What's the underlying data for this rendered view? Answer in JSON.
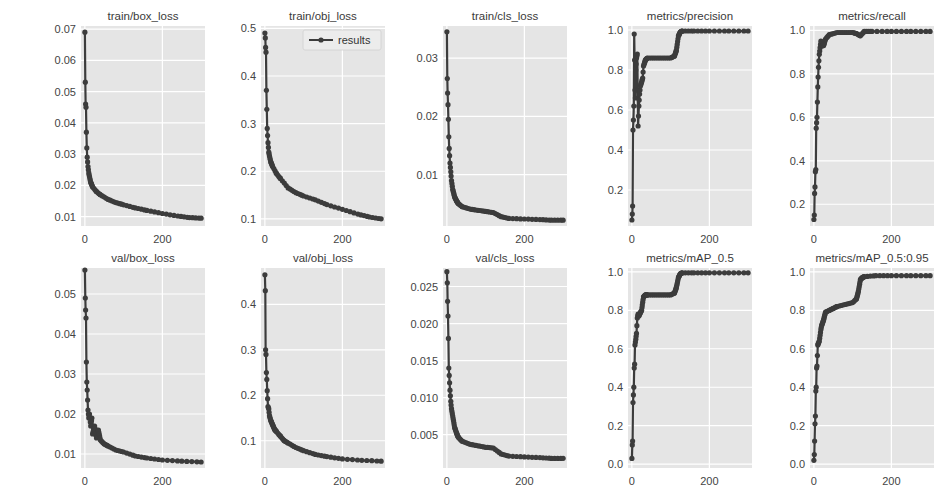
{
  "figure": {
    "background": "#ffffff",
    "axes_bg": "#e5e5e5",
    "grid_color": "#ffffff",
    "line_color": "#3c3c3c",
    "legend": {
      "label": "results",
      "panel": "train/obj_loss",
      "position": "upper right"
    }
  },
  "chart_data": [
    {
      "type": "line",
      "title": "train/box_loss",
      "xlabel": "",
      "ylabel": "",
      "xlim": [
        -10,
        310
      ],
      "ylim": [
        0.007,
        0.071
      ],
      "xticks": [
        0,
        200
      ],
      "yticks": [
        0.01,
        0.02,
        0.03,
        0.04,
        0.05,
        0.06,
        0.07
      ],
      "ytick_labels": [
        "0.01",
        "0.02",
        "0.03",
        "0.04",
        "0.05",
        "0.06",
        "0.07"
      ],
      "x": [
        0,
        1,
        2,
        3,
        4,
        5,
        6,
        8,
        10,
        15,
        20,
        30,
        40,
        60,
        80,
        100,
        130,
        160,
        200,
        240,
        270,
        300
      ],
      "y": [
        0.069,
        0.053,
        0.046,
        0.045,
        0.037,
        0.032,
        0.029,
        0.026,
        0.024,
        0.021,
        0.0195,
        0.018,
        0.017,
        0.0155,
        0.0145,
        0.0138,
        0.0128,
        0.012,
        0.011,
        0.0102,
        0.0097,
        0.0095
      ]
    },
    {
      "type": "line",
      "title": "train/obj_loss",
      "xlabel": "",
      "ylabel": "",
      "xlim": [
        -10,
        310
      ],
      "ylim": [
        0.085,
        0.505
      ],
      "xticks": [
        0,
        200
      ],
      "yticks": [
        0.1,
        0.2,
        0.3,
        0.4,
        0.5
      ],
      "ytick_labels": [
        "0.1",
        "0.2",
        "0.3",
        "0.4",
        "0.5"
      ],
      "x": [
        0,
        1,
        2,
        3,
        4,
        5,
        6,
        8,
        10,
        15,
        20,
        30,
        40,
        60,
        80,
        100,
        130,
        160,
        200,
        240,
        270,
        300
      ],
      "y": [
        0.49,
        0.48,
        0.46,
        0.45,
        0.37,
        0.33,
        0.29,
        0.26,
        0.24,
        0.22,
        0.21,
        0.195,
        0.185,
        0.165,
        0.155,
        0.148,
        0.14,
        0.13,
        0.12,
        0.11,
        0.104,
        0.1
      ]
    },
    {
      "type": "line",
      "title": "train/cls_loss",
      "xlabel": "",
      "ylabel": "",
      "xlim": [
        -10,
        310
      ],
      "ylim": [
        0.0012,
        0.0355
      ],
      "xticks": [
        0,
        200
      ],
      "yticks": [
        0.01,
        0.02,
        0.03
      ],
      "ytick_labels": [
        "0.01",
        "0.02",
        "0.03"
      ],
      "x": [
        0,
        1,
        2,
        3,
        4,
        5,
        6,
        8,
        10,
        12,
        15,
        20,
        25,
        30,
        40,
        60,
        80,
        100,
        120,
        140,
        160,
        200,
        240,
        270,
        300
      ],
      "y": [
        0.0345,
        0.0265,
        0.024,
        0.022,
        0.0195,
        0.0165,
        0.0145,
        0.012,
        0.0105,
        0.009,
        0.0075,
        0.0062,
        0.0055,
        0.005,
        0.0045,
        0.0041,
        0.0039,
        0.0037,
        0.0035,
        0.0028,
        0.0025,
        0.0024,
        0.0023,
        0.0022,
        0.0022
      ]
    },
    {
      "type": "line",
      "title": "metrics/precision",
      "xlabel": "",
      "ylabel": "",
      "xlim": [
        -10,
        310
      ],
      "ylim": [
        0.02,
        1.02
      ],
      "xticks": [
        0,
        200
      ],
      "yticks": [
        0.2,
        0.4,
        0.6,
        0.8,
        1.0
      ],
      "ytick_labels": [
        "0.2",
        "0.4",
        "0.6",
        "0.8",
        "1.0"
      ],
      "x": [
        0,
        1,
        2,
        3,
        4,
        5,
        6,
        7,
        8,
        9,
        10,
        12,
        14,
        16,
        18,
        20,
        22,
        25,
        28,
        30,
        35,
        40,
        60,
        80,
        100,
        110,
        115,
        120,
        125,
        130,
        160,
        200,
        250,
        300
      ],
      "y": [
        0.05,
        0.08,
        0.12,
        0.5,
        0.55,
        0.62,
        0.98,
        0.85,
        0.7,
        0.66,
        0.8,
        0.86,
        0.88,
        0.52,
        0.62,
        0.68,
        0.72,
        0.74,
        0.76,
        0.82,
        0.85,
        0.86,
        0.86,
        0.86,
        0.86,
        0.87,
        0.9,
        0.97,
        0.99,
        0.995,
        0.995,
        0.995,
        0.995,
        0.995
      ]
    },
    {
      "type": "line",
      "title": "metrics/recall",
      "xlabel": "",
      "ylabel": "",
      "xlim": [
        -10,
        310
      ],
      "ylim": [
        0.1,
        1.02
      ],
      "xticks": [
        0,
        200
      ],
      "yticks": [
        0.2,
        0.4,
        0.6,
        0.8,
        1.0
      ],
      "ytick_labels": [
        "0.2",
        "0.4",
        "0.6",
        "0.8",
        "1.0"
      ],
      "x": [
        0,
        1,
        2,
        3,
        4,
        5,
        6,
        8,
        10,
        12,
        14,
        16,
        18,
        20,
        25,
        30,
        40,
        60,
        80,
        100,
        110,
        120,
        130,
        150,
        200,
        250,
        300
      ],
      "y": [
        0.13,
        0.15,
        0.25,
        0.28,
        0.35,
        0.36,
        0.55,
        0.6,
        0.74,
        0.83,
        0.89,
        0.92,
        0.95,
        0.93,
        0.93,
        0.96,
        0.98,
        0.99,
        0.99,
        0.99,
        0.985,
        0.975,
        0.995,
        0.995,
        0.995,
        0.995,
        0.995
      ]
    },
    {
      "type": "line",
      "title": "val/box_loss",
      "xlabel": "",
      "ylabel": "",
      "xlim": [
        -10,
        310
      ],
      "ylim": [
        0.0065,
        0.0565
      ],
      "xticks": [
        0,
        200
      ],
      "yticks": [
        0.01,
        0.02,
        0.03,
        0.04,
        0.05
      ],
      "ytick_labels": [
        "0.01",
        "0.02",
        "0.03",
        "0.04",
        "0.05"
      ],
      "x": [
        0,
        1,
        2,
        3,
        4,
        5,
        6,
        8,
        10,
        12,
        15,
        18,
        20,
        25,
        30,
        35,
        40,
        50,
        60,
        80,
        100,
        130,
        160,
        200,
        250,
        300
      ],
      "y": [
        0.056,
        0.049,
        0.046,
        0.044,
        0.033,
        0.028,
        0.026,
        0.021,
        0.019,
        0.02,
        0.017,
        0.019,
        0.015,
        0.017,
        0.014,
        0.016,
        0.0135,
        0.0125,
        0.012,
        0.011,
        0.0105,
        0.0095,
        0.009,
        0.0085,
        0.0082,
        0.008
      ]
    },
    {
      "type": "line",
      "title": "val/obj_loss",
      "xlabel": "",
      "ylabel": "",
      "xlim": [
        -10,
        310
      ],
      "ylim": [
        0.04,
        0.48
      ],
      "xticks": [
        0,
        200
      ],
      "yticks": [
        0.1,
        0.2,
        0.3,
        0.4
      ],
      "ytick_labels": [
        "0.1",
        "0.2",
        "0.3",
        "0.4"
      ],
      "x": [
        0,
        1,
        2,
        3,
        4,
        5,
        6,
        8,
        10,
        12,
        15,
        20,
        25,
        30,
        40,
        50,
        60,
        80,
        100,
        130,
        160,
        200,
        250,
        300
      ],
      "y": [
        0.465,
        0.43,
        0.3,
        0.29,
        0.25,
        0.235,
        0.21,
        0.175,
        0.17,
        0.155,
        0.145,
        0.135,
        0.125,
        0.12,
        0.11,
        0.1,
        0.095,
        0.085,
        0.078,
        0.07,
        0.065,
        0.06,
        0.057,
        0.055
      ]
    },
    {
      "type": "line",
      "title": "val/cls_loss",
      "xlabel": "",
      "ylabel": "",
      "xlim": [
        -10,
        310
      ],
      "ylim": [
        0.0005,
        0.0275
      ],
      "xticks": [
        0,
        200
      ],
      "yticks": [
        0.005,
        0.01,
        0.015,
        0.02,
        0.025
      ],
      "ytick_labels": [
        "0.005",
        "0.010",
        "0.015",
        "0.020",
        "0.025"
      ],
      "x": [
        0,
        1,
        2,
        3,
        4,
        5,
        6,
        8,
        10,
        12,
        15,
        20,
        25,
        30,
        40,
        60,
        80,
        100,
        120,
        140,
        160,
        200,
        240,
        270,
        300
      ],
      "y": [
        0.027,
        0.0255,
        0.023,
        0.021,
        0.018,
        0.014,
        0.013,
        0.011,
        0.0095,
        0.0085,
        0.0075,
        0.006,
        0.0052,
        0.0046,
        0.0041,
        0.0037,
        0.0035,
        0.0033,
        0.0032,
        0.0024,
        0.0021,
        0.002,
        0.0019,
        0.0018,
        0.0018
      ]
    },
    {
      "type": "line",
      "title": "metrics/mAP_0.5",
      "xlabel": "",
      "ylabel": "",
      "xlim": [
        -10,
        310
      ],
      "ylim": [
        -0.02,
        1.02
      ],
      "xticks": [
        0,
        200
      ],
      "yticks": [
        0.0,
        0.2,
        0.4,
        0.6,
        0.8,
        1.0
      ],
      "ytick_labels": [
        "0.0",
        "0.2",
        "0.4",
        "0.6",
        "0.8",
        "1.0"
      ],
      "x": [
        0,
        1,
        2,
        3,
        4,
        5,
        6,
        7,
        8,
        10,
        12,
        14,
        16,
        18,
        20,
        25,
        30,
        35,
        40,
        60,
        80,
        100,
        110,
        115,
        120,
        125,
        130,
        160,
        200,
        250,
        300
      ],
      "y": [
        0.03,
        0.1,
        0.12,
        0.32,
        0.36,
        0.4,
        0.5,
        0.52,
        0.62,
        0.65,
        0.68,
        0.76,
        0.78,
        0.77,
        0.78,
        0.8,
        0.87,
        0.88,
        0.88,
        0.88,
        0.88,
        0.88,
        0.89,
        0.92,
        0.97,
        0.99,
        0.995,
        0.995,
        0.995,
        0.995,
        0.995
      ]
    },
    {
      "type": "line",
      "title": "metrics/mAP_0.5:0.95",
      "xlabel": "",
      "ylabel": "",
      "xlim": [
        -10,
        310
      ],
      "ylim": [
        -0.02,
        1.02
      ],
      "xticks": [
        0,
        200
      ],
      "yticks": [
        0.0,
        0.2,
        0.4,
        0.6,
        0.8,
        1.0
      ],
      "ytick_labels": [
        "0.0",
        "0.2",
        "0.4",
        "0.6",
        "0.8",
        "1.0"
      ],
      "x": [
        0,
        1,
        2,
        3,
        4,
        5,
        6,
        7,
        8,
        10,
        12,
        14,
        16,
        18,
        20,
        25,
        30,
        40,
        50,
        60,
        80,
        100,
        110,
        115,
        120,
        125,
        130,
        160,
        200,
        250,
        300
      ],
      "y": [
        0.02,
        0.05,
        0.12,
        0.21,
        0.25,
        0.38,
        0.4,
        0.5,
        0.51,
        0.62,
        0.63,
        0.64,
        0.67,
        0.7,
        0.72,
        0.75,
        0.79,
        0.8,
        0.81,
        0.82,
        0.83,
        0.84,
        0.86,
        0.9,
        0.96,
        0.97,
        0.975,
        0.98,
        0.98,
        0.98,
        0.98
      ]
    }
  ]
}
